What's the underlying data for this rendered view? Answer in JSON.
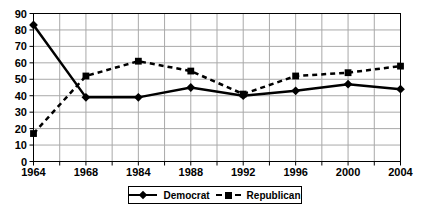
{
  "chart_data": {
    "type": "line",
    "title": "",
    "xlabel": "",
    "ylabel": "",
    "categories": [
      "1964",
      "1968",
      "1984",
      "1988",
      "1992",
      "1996",
      "2000",
      "2004"
    ],
    "series": [
      {
        "name": "Democrat",
        "values": [
          83,
          39,
          39,
          45,
          40,
          43,
          47,
          44
        ],
        "line_style": "solid",
        "marker": "diamond",
        "color": "#000000"
      },
      {
        "name": "Republican",
        "values": [
          17,
          52,
          61,
          55,
          41,
          52,
          54,
          58
        ],
        "line_style": "dashed",
        "marker": "square",
        "color": "#000000"
      }
    ],
    "ylim": [
      0,
      90
    ],
    "y_ticks": [
      0,
      10,
      20,
      30,
      40,
      50,
      60,
      70,
      80,
      90
    ],
    "grid": "on",
    "gridline_color": "#a9a9a9",
    "axis_color": "#000000",
    "background_color": "#ffffff",
    "legend_position": "bottom-center"
  }
}
